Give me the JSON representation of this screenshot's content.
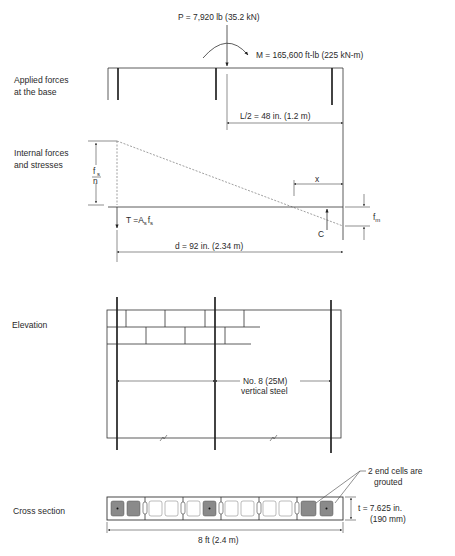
{
  "applied": {
    "label_line1": "Applied forces",
    "label_line2": "at the base",
    "axial_load": "P = 7,920 lb (35.2 kN)",
    "moment": "M = 165,600 ft-lb (225 kN-m)",
    "half_length": "L/2 = 48 in. (1.2 m)"
  },
  "internal": {
    "label_line1": "Internal forces",
    "label_line2": "and stresses",
    "steel_stress_num": "f",
    "steel_stress_num_sub": "s",
    "steel_stress_den": "n",
    "tension": "T =A",
    "tension_sub1": "s",
    "tension_mid": "f",
    "tension_sub2": "s",
    "neutral_axis": "x",
    "compression": "C",
    "masonry_stress": "f",
    "masonry_stress_sub": "m",
    "depth": "d = 92 in. (2.34 m)"
  },
  "elevation": {
    "label": "Elevation",
    "rebar_line1": "No. 8 (25M)",
    "rebar_line2": "vertical steel"
  },
  "cross_section": {
    "label": "Cross section",
    "grout_note_line1": "2 end cells are",
    "grout_note_line2": "grouted",
    "thickness_line1": "t = 7.625 in.",
    "thickness_line2": "(190 mm)",
    "length": "8 ft (2.4 m)"
  }
}
